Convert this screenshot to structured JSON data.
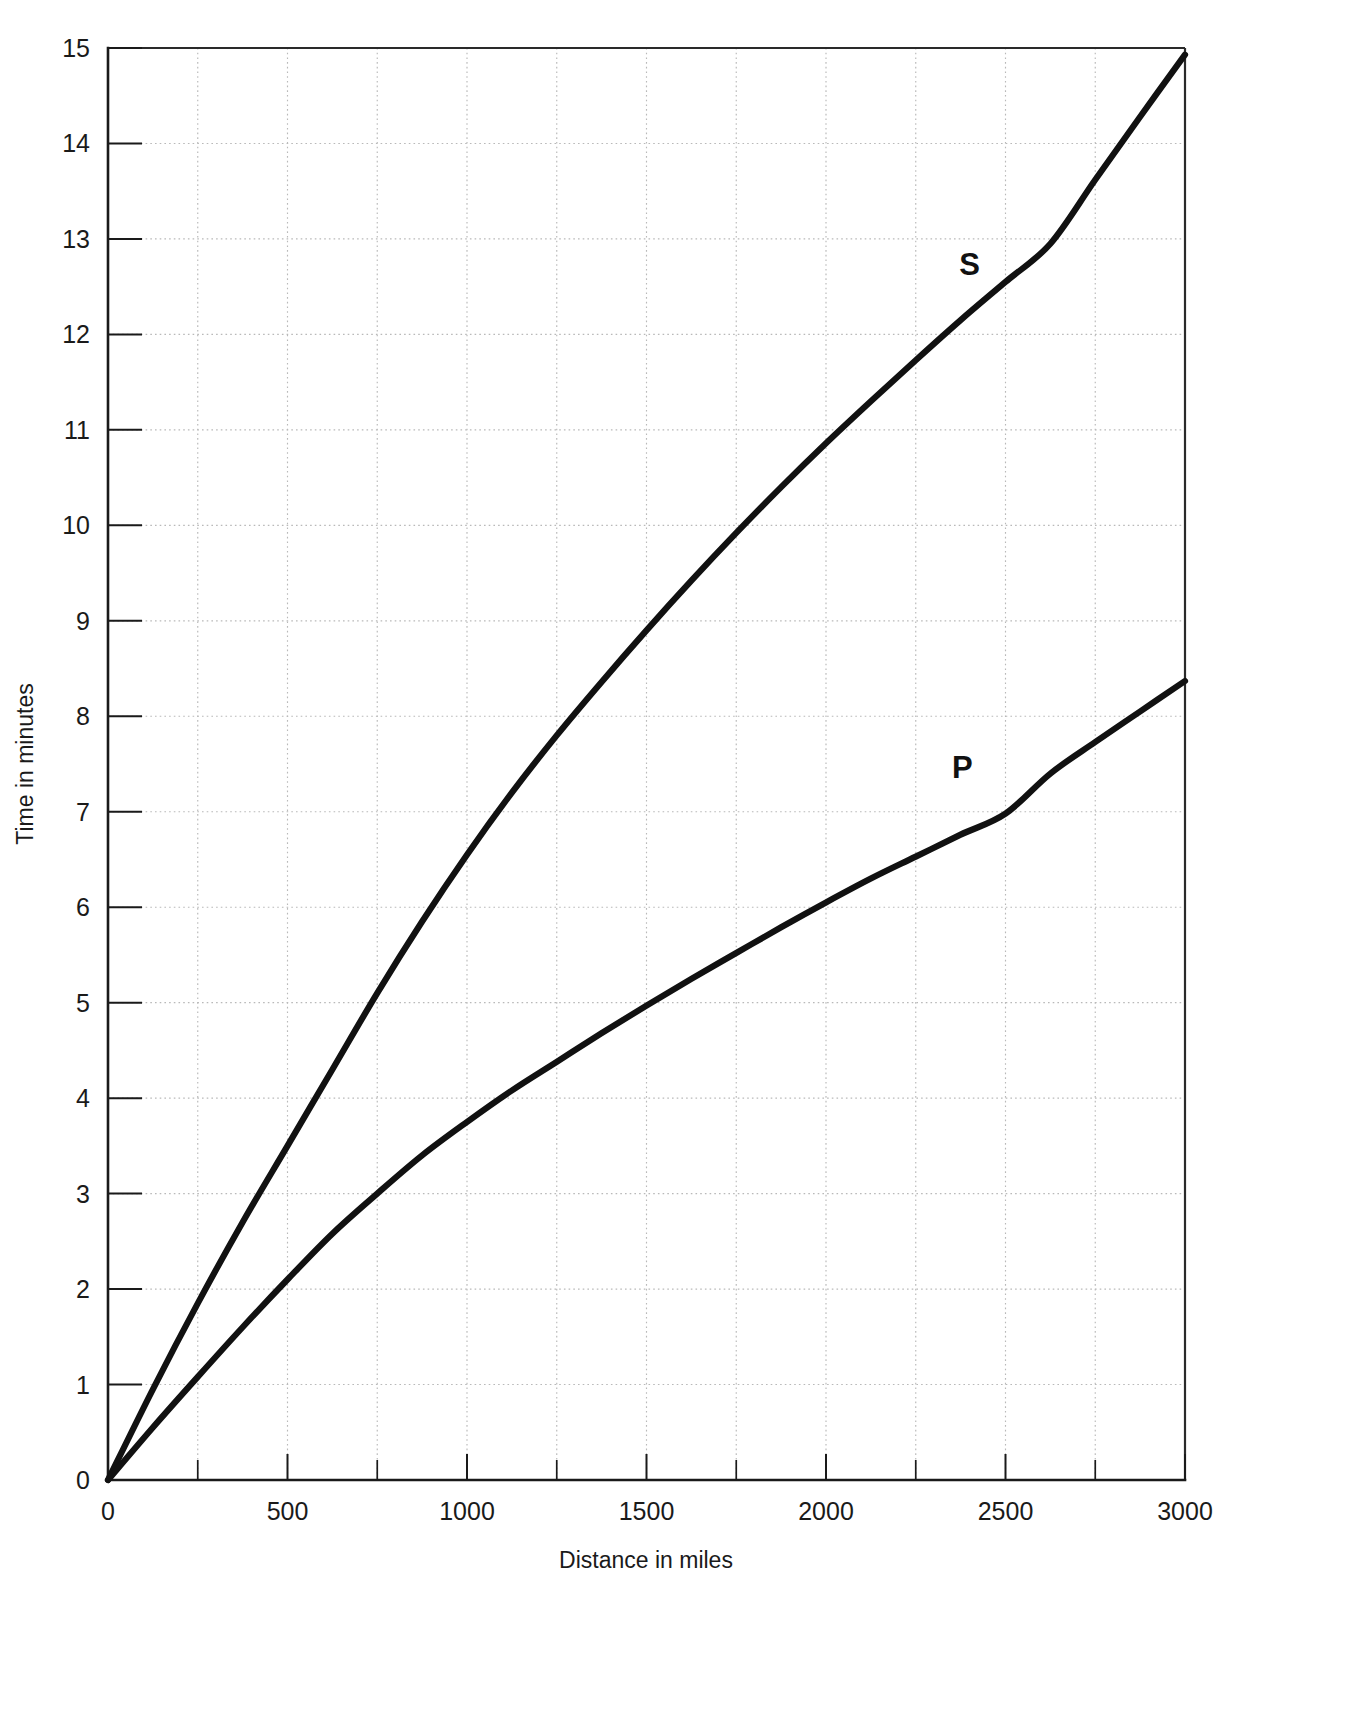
{
  "figure": {
    "background_color": "#ffffff",
    "curve_color": "#111111",
    "grid_color": "#b9b9b9",
    "axis_color": "#1a1a1a"
  },
  "chart_data": {
    "type": "line",
    "title": "",
    "subtitle": "",
    "xlabel": "Distance in miles",
    "ylabel": "Time in minutes",
    "xlim": [
      0,
      3000
    ],
    "ylim": [
      0,
      15
    ],
    "x_tick_labels": [
      "0",
      "500",
      "1000",
      "1500",
      "2000",
      "2500",
      "3000"
    ],
    "x_tick_values": [
      0,
      500,
      1000,
      1500,
      2000,
      2500,
      3000
    ],
    "x_minor_tick_values": [
      250,
      750,
      1250,
      1750,
      2250,
      2750
    ],
    "y_tick_labels": [
      "0",
      "1",
      "2",
      "3",
      "4",
      "5",
      "6",
      "7",
      "8",
      "9",
      "10",
      "11",
      "12",
      "13",
      "14",
      "15"
    ],
    "y_tick_values": [
      0,
      1,
      2,
      3,
      4,
      5,
      6,
      7,
      8,
      9,
      10,
      11,
      12,
      13,
      14,
      15
    ],
    "grid": true,
    "grid_x_values": [
      250,
      500,
      750,
      1000,
      1250,
      1500,
      1750,
      2000,
      2250,
      2500,
      2750
    ],
    "grid_y_values": [
      1,
      2,
      3,
      4,
      5,
      6,
      7,
      8,
      9,
      10,
      11,
      12,
      13,
      14
    ],
    "legend_position": "inline-curve-labels",
    "x": [
      0,
      125,
      250,
      375,
      500,
      625,
      750,
      875,
      1000,
      1125,
      1250,
      1375,
      1500,
      1625,
      1750,
      1875,
      2000,
      2125,
      2250,
      2375,
      2500,
      2625,
      2750,
      2875,
      3000
    ],
    "series": [
      {
        "name": "S",
        "label": "S",
        "label_x": 2400,
        "label_y": 12.62,
        "values": [
          0.0,
          0.95,
          1.85,
          2.7,
          3.5,
          4.3,
          5.1,
          5.85,
          6.55,
          7.2,
          7.8,
          8.36,
          8.9,
          9.42,
          9.92,
          10.4,
          10.86,
          11.3,
          11.73,
          12.15,
          12.55,
          12.95,
          13.62,
          14.28,
          14.93
        ]
      },
      {
        "name": "P",
        "label": "P",
        "label_x": 2380,
        "label_y": 7.35,
        "values": [
          0.0,
          0.55,
          1.08,
          1.6,
          2.1,
          2.58,
          3.0,
          3.4,
          3.75,
          4.08,
          4.38,
          4.68,
          4.97,
          5.25,
          5.52,
          5.79,
          6.05,
          6.3,
          6.53,
          6.76,
          6.98,
          7.4,
          7.73,
          8.05,
          8.37
        ]
      }
    ]
  }
}
